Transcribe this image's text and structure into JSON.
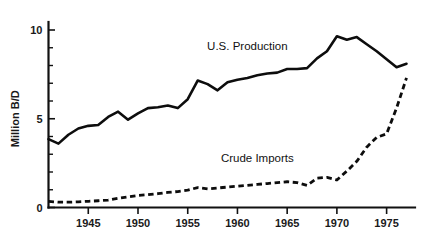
{
  "chart_data": {
    "type": "line",
    "title": "",
    "subtitle": "",
    "xlabel": "",
    "ylabel": "Million B/D",
    "xlim": [
      1941,
      1977
    ],
    "ylim": [
      0,
      10.6
    ],
    "grid": false,
    "legend_position": "inline-annotation",
    "x_ticks": [
      1945,
      1950,
      1955,
      1960,
      1965,
      1970,
      1975
    ],
    "x_tick_labels": [
      "1945",
      "1950",
      "1955",
      "1960",
      "1965",
      "1970",
      "1975"
    ],
    "y_ticks": [
      0,
      5,
      10
    ],
    "y_tick_labels": [
      "0",
      "5",
      "10"
    ],
    "y_minor_ticks": [
      1,
      2,
      3,
      4,
      6,
      7,
      8,
      9
    ],
    "x": [
      1941,
      1942,
      1943,
      1944,
      1945,
      1946,
      1947,
      1948,
      1949,
      1950,
      1951,
      1952,
      1953,
      1954,
      1955,
      1956,
      1957,
      1958,
      1959,
      1960,
      1961,
      1962,
      1963,
      1964,
      1965,
      1966,
      1967,
      1968,
      1969,
      1970,
      1971,
      1972,
      1973,
      1974,
      1975,
      1976,
      1977
    ],
    "series": [
      {
        "name": "U.S. Production",
        "style": "solid",
        "color": "#0d0d0d",
        "label_x": 1961,
        "label_y": 8.85,
        "values": [
          3.85,
          3.6,
          4.1,
          4.45,
          4.6,
          4.65,
          5.1,
          5.4,
          4.95,
          5.3,
          5.6,
          5.65,
          5.75,
          5.6,
          6.1,
          7.15,
          6.95,
          6.6,
          7.05,
          7.2,
          7.3,
          7.45,
          7.55,
          7.6,
          7.8,
          7.8,
          7.85,
          8.4,
          8.8,
          9.65,
          9.45,
          9.6,
          9.2,
          8.8,
          8.35,
          7.9,
          8.1
        ]
      },
      {
        "name": "Crude Imports",
        "style": "dashed",
        "color": "#0d0d0d",
        "label_x": 1962,
        "label_y": 2.55,
        "values": [
          0.35,
          0.3,
          0.3,
          0.32,
          0.35,
          0.38,
          0.42,
          0.52,
          0.6,
          0.68,
          0.72,
          0.78,
          0.85,
          0.9,
          0.98,
          1.12,
          1.05,
          1.1,
          1.15,
          1.2,
          1.25,
          1.3,
          1.35,
          1.4,
          1.45,
          1.4,
          1.25,
          1.65,
          1.7,
          1.55,
          2.05,
          2.6,
          3.4,
          3.95,
          4.15,
          5.6,
          7.3
        ]
      }
    ]
  }
}
